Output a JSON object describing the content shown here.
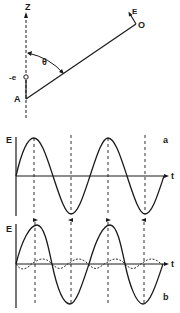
{
  "geometry_diagram": {
    "axis_label": "Z",
    "point_a_label": "A",
    "charge_label": "-e",
    "observer_label": "O",
    "field_label": "E",
    "angle_label": "θ"
  },
  "panel_a": {
    "panel_label": "a",
    "y_axis_label": "E",
    "x_axis_label": "t"
  },
  "panel_b": {
    "panel_label": "b",
    "y_axis_label": "E",
    "x_axis_label": "t"
  },
  "colors": {
    "ink": "#1a1a1a",
    "background": "#ffffff"
  }
}
